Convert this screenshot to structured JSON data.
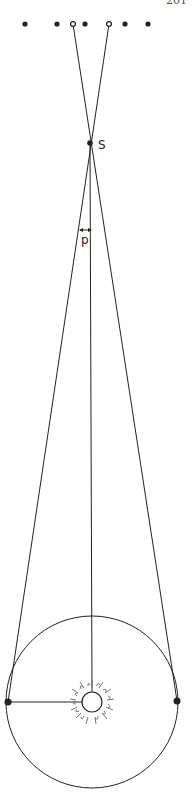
{
  "page": {
    "number": "201"
  },
  "figure": {
    "type": "stellar-parallax-diagram",
    "labels": {
      "star": "S",
      "parallax_angle": "p"
    },
    "colors": {
      "ink": "#222222",
      "sun_rays": "#777777",
      "background": "#ffffff"
    },
    "background_stars": [
      {
        "x": 25,
        "y": 24,
        "style": "filled"
      },
      {
        "x": 57,
        "y": 24,
        "style": "filled"
      },
      {
        "x": 73,
        "y": 24,
        "style": "ring"
      },
      {
        "x": 85,
        "y": 24,
        "style": "filled"
      },
      {
        "x": 109,
        "y": 24,
        "style": "ring"
      },
      {
        "x": 125,
        "y": 24,
        "style": "filled"
      },
      {
        "x": 148,
        "y": 24,
        "style": "filled"
      }
    ],
    "star_S": {
      "x": 90,
      "y": 143
    },
    "sun": {
      "x": 92,
      "y": 702,
      "r": 10
    },
    "earth_orbit": {
      "cx": 92,
      "cy": 702,
      "r": 86
    },
    "earth_positions": [
      {
        "x": 8,
        "y": 702,
        "name": "earth-left"
      },
      {
        "x": 177,
        "y": 701,
        "name": "earth-right"
      }
    ]
  }
}
